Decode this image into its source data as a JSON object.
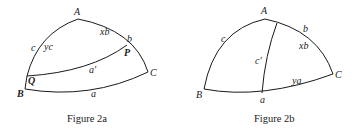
{
  "figures": [
    {
      "id": "fig2a",
      "caption": "Figure 2a",
      "vertices": {
        "A": "A",
        "B": "B",
        "C": "C",
        "P": "P",
        "Q": "Q"
      },
      "side_labels": {
        "c": "c",
        "yc": "yc",
        "xb": "xb",
        "b": "b",
        "a_prime": "a'",
        "a": "a"
      }
    },
    {
      "id": "fig2b",
      "caption": "Figure 2b",
      "vertices": {
        "A": "A",
        "B": "B",
        "C": "C"
      },
      "side_labels": {
        "c": "c",
        "c_prime": "c'",
        "b": "b",
        "xb": "xb",
        "ya": "ya",
        "a": "a"
      }
    }
  ],
  "colors": {
    "stroke": "#1a1a1a",
    "background": "#ffffff"
  }
}
